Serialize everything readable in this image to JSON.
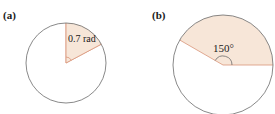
{
  "panels": [
    {
      "label": "(a)",
      "angle_label": "0.7 rad",
      "angle_value": 0.7,
      "angle_unit": "rad"
    },
    {
      "label": "(b)",
      "angle_label": "150°",
      "angle_value": 150,
      "angle_unit": "deg"
    }
  ],
  "colors": {
    "sector_fill": "#f7e6d8",
    "sector_edge": "#d9957a",
    "circle_stroke": "#6b6b6b",
    "text": "#1a1a1a"
  }
}
